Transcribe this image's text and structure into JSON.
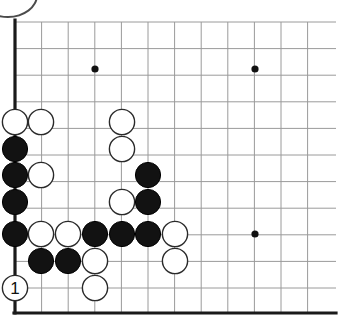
{
  "figure": {
    "kind": "go-board-diagram",
    "background_color": "#ffffff",
    "line_color": "#9a9a9a",
    "edge_color": "#1a1a1a",
    "black_color": "#121212",
    "white_color": "#ffffff"
  },
  "board": {
    "origin_x": 15,
    "origin_y": 22,
    "spacing": 26.6,
    "columns": 12,
    "rows": 11,
    "stone_radius": 12.6,
    "left_edge_x": 15,
    "bottom_edge_y": 313,
    "hoshi_radius": 3.6,
    "hoshi_points": [
      {
        "x": 95,
        "y": 69
      },
      {
        "x": 255,
        "y": 69
      },
      {
        "x": 255,
        "y": 234
      }
    ]
  },
  "stones": [
    {
      "id": "w-a",
      "color": "white",
      "x": 15,
      "y": 122
    },
    {
      "id": "w-b",
      "color": "white",
      "x": 41,
      "y": 122
    },
    {
      "id": "w-c",
      "color": "white",
      "x": 122,
      "y": 122
    },
    {
      "id": "b-a",
      "color": "black",
      "x": 15,
      "y": 149
    },
    {
      "id": "w-d",
      "color": "white",
      "x": 122,
      "y": 149
    },
    {
      "id": "b-b",
      "color": "black",
      "x": 15,
      "y": 175
    },
    {
      "id": "w-e",
      "color": "white",
      "x": 41,
      "y": 175
    },
    {
      "id": "b-c",
      "color": "black",
      "x": 148,
      "y": 175
    },
    {
      "id": "b-d",
      "color": "black",
      "x": 15,
      "y": 202
    },
    {
      "id": "w-f",
      "color": "white",
      "x": 122,
      "y": 202
    },
    {
      "id": "b-e",
      "color": "black",
      "x": 148,
      "y": 202
    },
    {
      "id": "b-f",
      "color": "black",
      "x": 15,
      "y": 234
    },
    {
      "id": "w-g",
      "color": "white",
      "x": 41,
      "y": 234
    },
    {
      "id": "w-h",
      "color": "white",
      "x": 68,
      "y": 234
    },
    {
      "id": "b-g",
      "color": "black",
      "x": 95,
      "y": 234
    },
    {
      "id": "b-h",
      "color": "black",
      "x": 122,
      "y": 234
    },
    {
      "id": "b-i",
      "color": "black",
      "x": 148,
      "y": 234
    },
    {
      "id": "w-i",
      "color": "white",
      "x": 175,
      "y": 234
    },
    {
      "id": "b-j",
      "color": "black",
      "x": 41,
      "y": 261
    },
    {
      "id": "b-k",
      "color": "black",
      "x": 68,
      "y": 261
    },
    {
      "id": "w-j",
      "color": "white",
      "x": 95,
      "y": 261
    },
    {
      "id": "w-k",
      "color": "white",
      "x": 175,
      "y": 261
    },
    {
      "id": "w-l",
      "color": "white",
      "x": 95,
      "y": 288
    }
  ],
  "move_markers": [
    {
      "label": "1",
      "x": 15,
      "y": 288,
      "stone_color": "white",
      "text_color": "#111111"
    }
  ]
}
